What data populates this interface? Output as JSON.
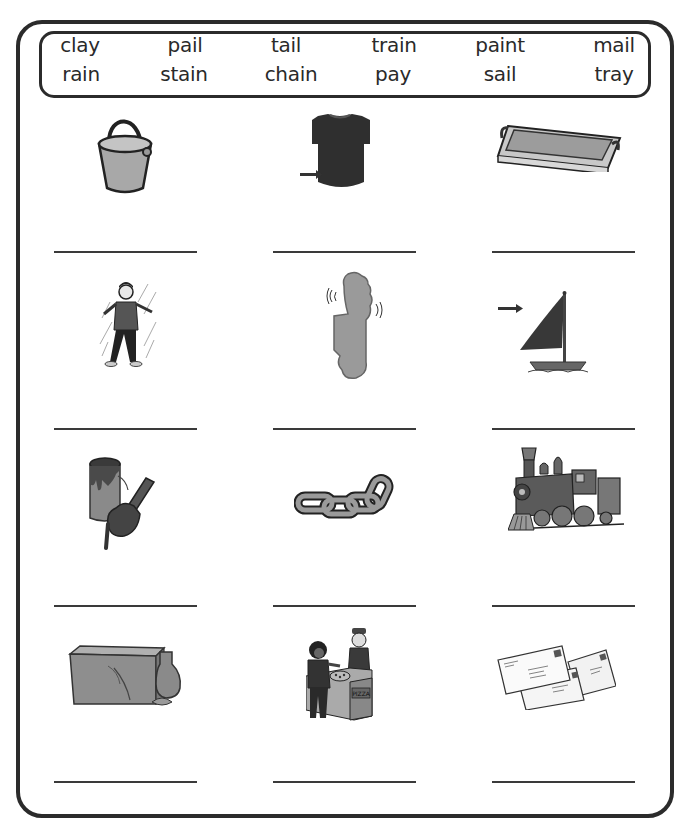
{
  "word_bank": {
    "rows": [
      [
        "clay",
        "pail",
        "tail",
        "train",
        "paint",
        "mail"
      ],
      [
        "rain",
        "stain",
        "chain",
        "pay",
        "sail",
        "tray"
      ]
    ]
  },
  "picture_grid": {
    "rows": [
      [
        {
          "picture": "bucket-pail-icon",
          "answer": ""
        },
        {
          "picture": "shirt-stain-arrow-icon",
          "answer": ""
        },
        {
          "picture": "serving-tray-icon",
          "answer": ""
        }
      ],
      [
        {
          "picture": "boy-in-rain-icon",
          "answer": ""
        },
        {
          "picture": "wiggling-foot-icon",
          "answer": ""
        },
        {
          "picture": "sailboat-sail-arrow-icon",
          "answer": ""
        }
      ],
      [
        {
          "picture": "paint-can-brush-icon",
          "answer": ""
        },
        {
          "picture": "chain-links-icon",
          "answer": ""
        },
        {
          "picture": "steam-train-icon",
          "answer": ""
        }
      ],
      [
        {
          "picture": "clay-block-icon",
          "answer": ""
        },
        {
          "picture": "paying-for-pizza-icon",
          "answer": ""
        },
        {
          "picture": "mail-envelopes-icon",
          "answer": ""
        }
      ]
    ],
    "pizza_sign": "PIZZA"
  },
  "colors": {
    "border": "#2b2b2b",
    "line": "#3a3a3a",
    "gray_fill": "#9a9a9a",
    "dark_fill": "#333333"
  }
}
